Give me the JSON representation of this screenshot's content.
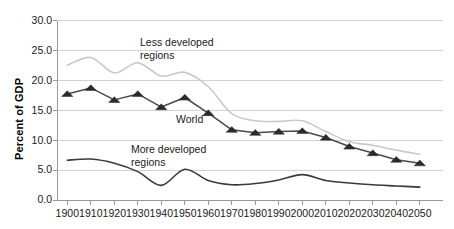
{
  "chart_data": {
    "type": "line",
    "title": "",
    "subtitle": "",
    "xlabel": "",
    "ylabel": "Percent of GDP",
    "xlim": [
      1900,
      2050
    ],
    "ylim": [
      0.0,
      30.0
    ],
    "grid": true,
    "legend_position": "inline-annotations",
    "x": [
      1900,
      1910,
      1920,
      1930,
      1940,
      1950,
      1960,
      1970,
      1980,
      1990,
      2000,
      2010,
      2020,
      2030,
      2040,
      2050
    ],
    "xtick_labels": [
      "1900",
      "1910",
      "1920",
      "1930",
      "1940",
      "1950",
      "1960",
      "1970",
      "1980",
      "1990",
      "2000",
      "2010",
      "2020",
      "2030",
      "2040",
      "2050"
    ],
    "ytick_labels": [
      "30.0",
      "25.0",
      "20.0",
      "15.0",
      "10.0",
      "5.0",
      "0.0"
    ],
    "ytick_values": [
      30.0,
      25.0,
      20.0,
      15.0,
      10.0,
      5.0,
      0.0
    ],
    "series": [
      {
        "name": "Less developed regions",
        "color": "#c9c9c9",
        "marker": "none",
        "values": [
          22.6,
          23.9,
          21.3,
          23.0,
          20.8,
          21.4,
          19.0,
          14.5,
          13.3,
          13.2,
          13.3,
          11.5,
          9.8,
          9.2,
          8.4,
          7.7
        ]
      },
      {
        "name": "World",
        "color": "#4a4a4a",
        "marker": "triangle",
        "values": [
          17.8,
          18.8,
          16.8,
          17.8,
          15.6,
          17.2,
          14.6,
          11.8,
          11.3,
          11.5,
          11.6,
          10.5,
          9.0,
          7.9,
          6.8,
          6.2
        ]
      },
      {
        "name": "More developed regions",
        "color": "#3a3a3a",
        "marker": "none",
        "values": [
          6.7,
          6.9,
          6.2,
          4.8,
          2.5,
          5.2,
          3.3,
          2.6,
          2.8,
          3.4,
          4.3,
          3.3,
          2.9,
          2.6,
          2.4,
          2.2
        ]
      }
    ],
    "annotations": [
      {
        "text": "Less developed\nregions",
        "x_px": 140,
        "y_px": 36
      },
      {
        "text": "World",
        "x_px": 176,
        "y_px": 113
      },
      {
        "text": "More developed\nregions",
        "x_px": 131,
        "y_px": 143
      }
    ]
  },
  "axis": {
    "y_title": "Percent of GDP"
  },
  "colors": {
    "less_developed": "#c9c9c9",
    "world": "#4a4a4a",
    "more_developed": "#3a3a3a",
    "gridline": "#d2d2d2",
    "axis": "#9a9a9a",
    "text": "#1a1a1a",
    "background": "#ffffff"
  }
}
